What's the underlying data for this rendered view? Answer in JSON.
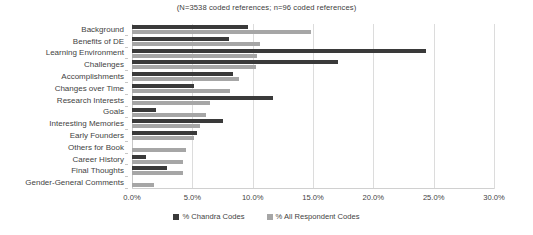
{
  "chart_data": {
    "type": "bar",
    "orientation": "horizontal",
    "title": "(N=3538 coded references;  n=96 coded references)",
    "xlabel": "",
    "ylabel": "",
    "xlim": [
      0,
      30
    ],
    "xticks": [
      "0.0%",
      "5.0%",
      "10.0%",
      "15.0%",
      "20.0%",
      "25.0%",
      "30.0%"
    ],
    "xtick_values": [
      0,
      5,
      10,
      15,
      20,
      25,
      30
    ],
    "grid": true,
    "legend_position": "bottom",
    "categories": [
      "Background",
      "Benefits of DE",
      "Learning Environment",
      "Challenges",
      "Accomplishments",
      "Changes over Time",
      "Research Interests",
      "Goals",
      "Interesting Memories",
      "Early Founders",
      "Others for Book",
      "Career History",
      "Final Thoughts",
      "Gender-General Comments"
    ],
    "series": [
      {
        "name": "% Chandra Codes",
        "color": "#3a3a3a",
        "values": [
          9.6,
          8.0,
          24.4,
          17.1,
          8.4,
          5.1,
          11.7,
          2.0,
          7.5,
          5.4,
          0.0,
          1.2,
          2.9,
          0.0
        ]
      },
      {
        "name": "% All Respondent Codes",
        "color": "#a6a6a6",
        "values": [
          14.8,
          10.6,
          10.4,
          10.3,
          8.9,
          8.1,
          6.5,
          6.1,
          5.6,
          5.1,
          4.5,
          4.2,
          4.2,
          1.8
        ]
      }
    ]
  }
}
